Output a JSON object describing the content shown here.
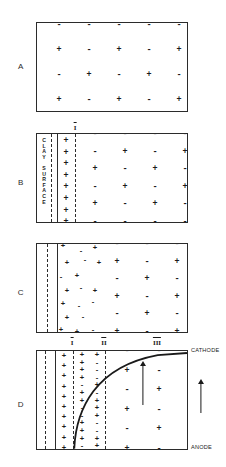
{
  "figure": {
    "ink_color": "#1a1a1a",
    "background": "#ffffff"
  },
  "panels": [
    {
      "letter": "A",
      "name": "bulk-electrolyte",
      "charge_rows": [
        [
          "-",
          "-",
          "-",
          "-",
          "-"
        ],
        [
          "+",
          "-",
          "+",
          "-",
          "+"
        ],
        [
          "-",
          "+",
          "-",
          "+",
          "-"
        ],
        [
          "+",
          "-",
          "+",
          "-",
          "+"
        ]
      ]
    },
    {
      "letter": "B",
      "name": "clay-surface-fixed-layer",
      "surface_caption_line1": "CLAY",
      "surface_caption_line2": "SURFACE",
      "surface_caption_chars": [
        "C",
        "L",
        "A",
        "Y",
        "",
        "S",
        "U",
        "R",
        "F",
        "A",
        "C",
        "E"
      ],
      "zone_labels": [
        "I"
      ],
      "fixed_layer_charges": [
        "+",
        "+",
        "+",
        "+",
        "+",
        "+",
        "+",
        "+"
      ],
      "charge_rows": [
        [
          "-",
          "-",
          "-",
          "-"
        ],
        [
          "-",
          "+",
          "-",
          "+"
        ],
        [
          "+",
          "-",
          "+",
          "-"
        ],
        [
          "-",
          "+",
          "-",
          "+"
        ],
        [
          "+",
          "-",
          "+",
          "-"
        ],
        [
          "-",
          "-",
          "-",
          "-"
        ]
      ]
    },
    {
      "letter": "C",
      "name": "diffuse-double-layer",
      "scatter_charges": [
        "+",
        "-",
        "+",
        "+",
        "-",
        "+",
        "-",
        "+",
        "+",
        "-",
        "+",
        "+",
        "-",
        "-",
        "+",
        "-",
        "+",
        "+",
        "-",
        "+",
        "+",
        "-"
      ],
      "charge_rows": [
        [
          "-",
          "-",
          "-",
          "-"
        ],
        [
          "+",
          "-",
          "+",
          "-"
        ],
        [
          "-",
          "+",
          "-",
          "+"
        ],
        [
          "+",
          "-",
          "+",
          "-"
        ],
        [
          "-",
          "+",
          "-",
          "+"
        ],
        [
          "+",
          "-",
          "+",
          "-"
        ]
      ]
    },
    {
      "letter": "D",
      "name": "electro-osmotic-velocity-profile",
      "zone_labels": [
        "I",
        "II",
        "III"
      ],
      "electrode_top": "CATHODE",
      "electrode_bottom": "ANODE",
      "fixed_layer_charges": [
        "+",
        "+",
        "+",
        "+",
        "+",
        "+",
        "+",
        "+",
        "+",
        "+"
      ],
      "mobile_layer_charges": [
        "+",
        "+",
        "+",
        "-",
        "+",
        "-",
        "+",
        "-",
        "-",
        "+",
        "+",
        "-",
        "+",
        "+",
        "-",
        "+",
        "-",
        "+",
        "+",
        "-",
        "+",
        "-",
        "+",
        "+",
        "-",
        "+"
      ],
      "charge_rows": [
        [
          "-",
          "-",
          "-"
        ],
        [
          "+",
          "-",
          "+"
        ],
        [
          "-",
          "+",
          "-"
        ],
        [
          "+",
          "-",
          "+"
        ],
        [
          "-",
          "+",
          "-"
        ],
        [
          "+",
          "-",
          "+"
        ]
      ],
      "flow_arrow_name": "electro-osmotic-flow-arrow",
      "external_arrow_name": "bulk-flow-direction-arrow"
    }
  ]
}
